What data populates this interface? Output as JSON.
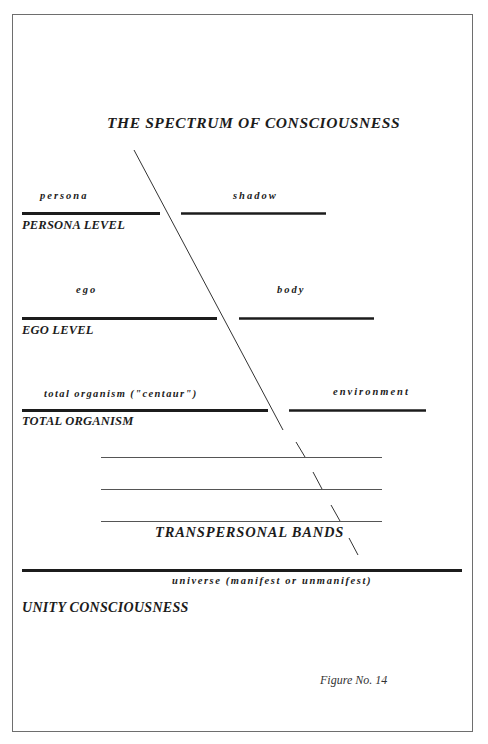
{
  "title": "THE SPECTRUM OF CONSCIOUSNESS",
  "levels": [
    {
      "name": "PERSONA LEVEL",
      "left_label": "persona",
      "right_label": "shadow"
    },
    {
      "name": "EGO LEVEL",
      "left_label": "ego",
      "right_label": "body"
    },
    {
      "name": "TOTAL ORGANISM",
      "left_label": "total organism (\"centaur\")",
      "right_label": "environment"
    }
  ],
  "transpersonal": {
    "label": "TRANSPERSONAL BANDS",
    "band_count": 3
  },
  "unity": {
    "name": "UNITY CONSCIOUSNESS",
    "label": "universe (manifest or unmanifest)"
  },
  "caption": "Figure No. 14",
  "colors": {
    "ink": "#1c1c1c",
    "frame": "#6e6e6e",
    "thin_line": "#555555",
    "background": "#ffffff"
  }
}
